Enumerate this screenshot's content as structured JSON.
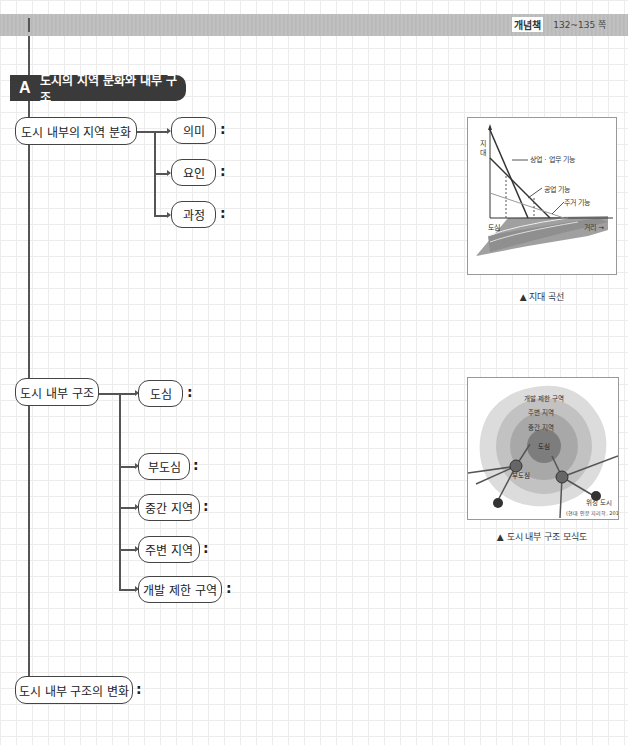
{
  "header": {
    "book_label": "개념책",
    "pages": "132~135 쪽"
  },
  "section": {
    "letter": "A",
    "title": "도시의 지역 분화와 내부 구조"
  },
  "nodes": {
    "differentiation": {
      "label": "도시 내부의 지역 분화",
      "children": [
        {
          "label": "의미",
          "colon": ":"
        },
        {
          "label": "요인",
          "colon": ":"
        },
        {
          "label": "과정",
          "colon": ":"
        }
      ]
    },
    "structure": {
      "label": "도시 내부 구조",
      "children": [
        {
          "label": "도심",
          "colon": ":"
        },
        {
          "label": "부도심",
          "colon": ":"
        },
        {
          "label": "중간 지역",
          "colon": ":"
        },
        {
          "label": "주변 지역",
          "colon": ":"
        },
        {
          "label": "개발 제한 구역",
          "colon": ":"
        }
      ]
    },
    "change": {
      "label": "도시 내부 구조의 변화",
      "colon": ":"
    }
  },
  "figure1": {
    "y_axis": "지대",
    "x_axis": "거리",
    "center": "도심",
    "lines": [
      "상업·업무 기능",
      "공업 기능",
      "주거 기능"
    ],
    "caption": "▲ 지대 곡선"
  },
  "figure2": {
    "zones": [
      "개발 제한 구역",
      "주변 지역",
      "중간 지역",
      "도심"
    ],
    "subcenter": "부도심",
    "satellite": "위성 도시",
    "source": "(현대 인문 지리학, 2012)",
    "caption": "▲ 도시 내부 구조 모식도"
  }
}
